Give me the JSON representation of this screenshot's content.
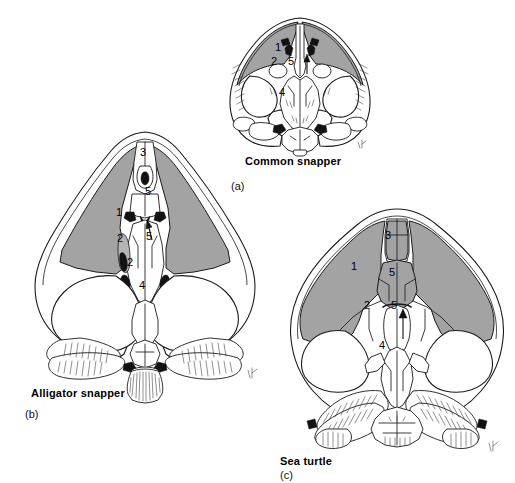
{
  "figure": {
    "type": "scientific-anatomical-illustration",
    "background_color": "#ffffff",
    "shade_color": "#a3a3a3",
    "line_color": "#1a1a1a"
  },
  "panels": [
    {
      "id": "a",
      "letter": "(a)",
      "caption": "Common snapper",
      "labels": [
        {
          "text": "1",
          "x": 275,
          "y": 47
        },
        {
          "text": "2",
          "x": 272,
          "y": 61
        },
        {
          "text": "5",
          "x": 288,
          "y": 61
        },
        {
          "text": "4",
          "x": 280,
          "y": 92
        }
      ]
    },
    {
      "id": "b",
      "letter": "(b)",
      "caption": "Alligator snapper",
      "labels": [
        {
          "text": "3",
          "x": 142,
          "y": 152
        },
        {
          "text": "5",
          "x": 147,
          "y": 191
        },
        {
          "text": "1",
          "x": 118,
          "y": 212
        },
        {
          "text": "2",
          "x": 118,
          "y": 238
        },
        {
          "text": "5",
          "x": 148,
          "y": 236
        },
        {
          "text": "2",
          "x": 128,
          "y": 262
        },
        {
          "text": "4",
          "x": 140,
          "y": 285
        }
      ]
    },
    {
      "id": "c",
      "letter": "(c)",
      "caption": "Sea turtle",
      "labels": [
        {
          "text": "3",
          "x": 386,
          "y": 235
        },
        {
          "text": "1",
          "x": 352,
          "y": 266
        },
        {
          "text": "5",
          "x": 390,
          "y": 272
        },
        {
          "text": "2",
          "x": 365,
          "y": 305
        },
        {
          "text": "5",
          "x": 392,
          "y": 305
        },
        {
          "text": "4",
          "x": 380,
          "y": 345
        }
      ]
    }
  ],
  "captions": {
    "a_caption": "Common snapper",
    "a_letter": "(a)",
    "b_caption": "Alligator snapper",
    "b_letter": "(b)",
    "c_caption": "Sea turtle",
    "c_letter": "(c)"
  }
}
